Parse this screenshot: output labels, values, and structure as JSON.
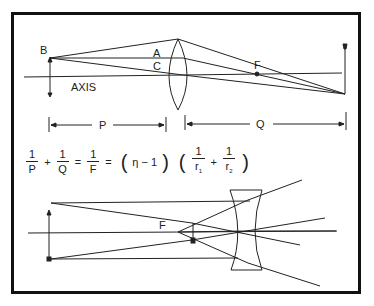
{
  "figure": {
    "top_diagram": {
      "title": "Converging (convex) lens",
      "labels": {
        "object_tip": "B",
        "ray_point_a": "A",
        "ray_point_c": "C",
        "axis": "AXIS",
        "focal_point": "F",
        "object_distance": "P",
        "image_distance": "Q"
      }
    },
    "equation": {
      "lhs_1_num": "1",
      "lhs_1_den": "P",
      "plus_1": "+",
      "lhs_2_num": "1",
      "lhs_2_den": "Q",
      "equals_1": "=",
      "mid_num": "1",
      "mid_den": "F",
      "equals_2": "=",
      "factor_1": "η − 1",
      "r1_num": "1",
      "r1_den": "r",
      "r1_sub": "1",
      "plus_2": "+",
      "r2_num": "1",
      "r2_den": "r",
      "r2_sub": "2"
    },
    "bottom_diagram": {
      "title": "Diverging (concave) lens",
      "labels": {
        "focal_point": "F"
      }
    },
    "colors": {
      "line": "#222222",
      "frame": "#111111",
      "background": "#ffffff"
    }
  }
}
